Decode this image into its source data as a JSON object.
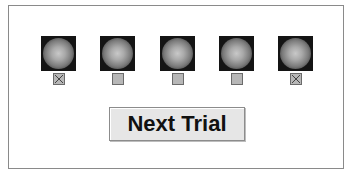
{
  "trials": {
    "stimuli": [
      {
        "checked": true
      },
      {
        "checked": false
      },
      {
        "checked": false
      },
      {
        "checked": false
      },
      {
        "checked": true
      }
    ]
  },
  "buttons": {
    "next_trial_label": "Next Trial"
  },
  "colors": {
    "stimulus_background": "#141414",
    "checkbox_fill": "#b7b7b7",
    "button_background": "#e6e6e6"
  }
}
